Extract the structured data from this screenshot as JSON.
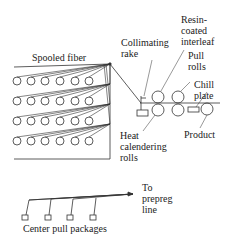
{
  "diagram": {
    "title": "",
    "labels": {
      "spooled_fiber": "Spooled fiber",
      "collimating_rake": "Collimating\nrake",
      "resin_interleaf": "Resin-\ncoated\ninterleaf",
      "pull_rolls": "Pull\nrolls",
      "chill_plate": "Chill\nplate",
      "heat_calendering": "Heat\ncalendering\nrolls",
      "product": "Product",
      "to_prepreg": "To\nprepreg\nline",
      "center_pull": "Center pull packages"
    },
    "creel": {
      "rows": 4,
      "spools_per_row": 6
    },
    "center_pull_packages": 4,
    "colors": {
      "line": "#333333",
      "text": "#222222"
    }
  }
}
